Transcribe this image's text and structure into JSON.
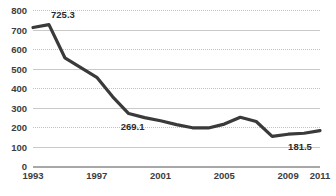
{
  "chart_data": {
    "type": "line",
    "title": "",
    "xlabel": "",
    "ylabel": "",
    "ylim": [
      0,
      800
    ],
    "ytick_step": 100,
    "yticks": [
      "0",
      "100",
      "200",
      "300",
      "400",
      "500",
      "600",
      "700",
      "800"
    ],
    "xlim": [
      1993,
      2011
    ],
    "xticks": [
      "1993",
      "1997",
      "2001",
      "2005",
      "2009",
      "2011"
    ],
    "xtick_values": [
      1993,
      1997,
      2001,
      2005,
      2009,
      2011
    ],
    "grid": true,
    "legend": false,
    "line_color": "#3a3a3a",
    "grid_color": "#c5c5c5",
    "x": [
      1993,
      1994,
      1995,
      1996,
      1997,
      1998,
      1999,
      2000,
      2001,
      2002,
      2003,
      2004,
      2005,
      2006,
      2007,
      2008,
      2009,
      2010,
      2011
    ],
    "values": [
      710.0,
      725.3,
      555.0,
      505.0,
      455.0,
      355.0,
      269.1,
      248.0,
      232.0,
      212.0,
      196.0,
      195.0,
      215.0,
      250.0,
      228.0,
      152.0,
      163.0,
      168.0,
      181.5
    ],
    "annotations": [
      {
        "label": "725.3",
        "x": 1994,
        "y": 725.3,
        "position": "above"
      },
      {
        "label": "269.1",
        "x": 1999,
        "y": 269.1,
        "position": "below"
      },
      {
        "label": "181.5",
        "x": 2011,
        "y": 181.5,
        "position": "below-left"
      }
    ]
  }
}
